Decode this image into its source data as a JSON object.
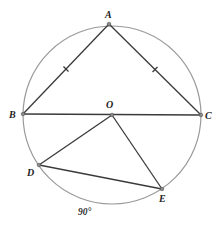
{
  "diagram": {
    "type": "geometry",
    "colors": {
      "circle": "#9a9a9a",
      "segment": "#3a3a3a",
      "point_fill": "#8a8a8a",
      "label": "#222222"
    },
    "circle": {
      "center": "O",
      "cx": 112,
      "cy": 115,
      "r": 89
    },
    "points": [
      {
        "name": "A",
        "x": 109,
        "y": 24,
        "label": "A",
        "label_x": 105,
        "label_y": 18
      },
      {
        "name": "B",
        "x": 23,
        "y": 114,
        "label": "B",
        "label_x": 9,
        "label_y": 118
      },
      {
        "name": "C",
        "x": 201,
        "y": 115,
        "label": "C",
        "label_x": 205,
        "label_y": 119
      },
      {
        "name": "O",
        "x": 112,
        "y": 115,
        "label": "O",
        "label_x": 106,
        "label_y": 108
      },
      {
        "name": "D",
        "x": 39,
        "y": 165,
        "label": "D",
        "label_x": 27,
        "label_y": 176
      },
      {
        "name": "E",
        "x": 162,
        "y": 189,
        "label": "E",
        "label_x": 159,
        "label_y": 202
      }
    ],
    "segments": [
      {
        "from": "A",
        "to": "B",
        "tick": true
      },
      {
        "from": "A",
        "to": "C",
        "tick": true
      },
      {
        "from": "B",
        "to": "C",
        "tick": false
      },
      {
        "from": "O",
        "to": "D",
        "tick": false
      },
      {
        "from": "O",
        "to": "E",
        "tick": false
      },
      {
        "from": "D",
        "to": "E",
        "tick": false
      }
    ],
    "annotations": [
      {
        "text": "90°",
        "refers_to": "arc DE",
        "x": 78,
        "y": 215
      }
    ]
  }
}
